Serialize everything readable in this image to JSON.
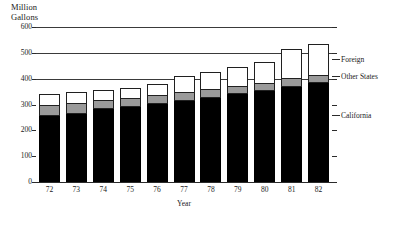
{
  "chart_data": {
    "type": "bar",
    "subtype": "stacked-bar",
    "title": "",
    "ylabel": "Million\nGallons",
    "xlabel": "Year",
    "categories": [
      "72",
      "73",
      "74",
      "75",
      "76",
      "77",
      "78",
      "79",
      "80",
      "81",
      "82"
    ],
    "ylim": [
      0,
      600
    ],
    "yticks": [
      0,
      100,
      200,
      300,
      400,
      500,
      600
    ],
    "ytick_labels": [
      "0",
      "100",
      "200",
      "300",
      "400",
      "500",
      "600"
    ],
    "grid": true,
    "grid_axis": "y",
    "grid_lines_drawn": [
      400,
      500,
      600
    ],
    "legend_position": "right-inline-callout",
    "series": [
      {
        "name": "California",
        "color": "#000000",
        "values": [
          255,
          262,
          283,
          290,
          302,
          315,
          325,
          340,
          352,
          368,
          383
        ]
      },
      {
        "name": "Other States",
        "color": "#9a9a9a",
        "values": [
          42,
          45,
          33,
          35,
          33,
          35,
          35,
          33,
          32,
          33,
          32
        ]
      },
      {
        "name": "Foreign",
        "color": "#ffffff",
        "values": [
          43,
          41,
          42,
          40,
          45,
          60,
          65,
          72,
          81,
          114,
          120
        ]
      }
    ],
    "totals": [
      340,
      348,
      358,
      365,
      380,
      410,
      425,
      445,
      465,
      515,
      535
    ]
  },
  "legend": {
    "items": [
      {
        "label": "Foreign",
        "color": "#ffffff"
      },
      {
        "label": "Other States",
        "color": "#9a9a9a"
      },
      {
        "label": "California",
        "color": "#000000"
      }
    ]
  },
  "axes": {
    "y_title_line1": "Million",
    "y_title_line2": "Gallons",
    "x_title": "Year"
  }
}
